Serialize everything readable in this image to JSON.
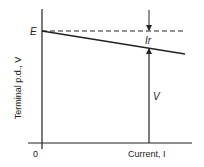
{
  "diagram": {
    "y_axis_label": "Terminal p.d., V",
    "x_axis_label": "Current, I",
    "origin_label": "0",
    "intercept_label": "E",
    "drop_label": "Ir",
    "voltage_label": "V",
    "line_color": "#222222",
    "elements": [
      {
        "type": "axis",
        "name": "y-axis"
      },
      {
        "type": "axis",
        "name": "x-axis"
      },
      {
        "type": "dashed-line",
        "name": "emf-level",
        "meaning": "E constant"
      },
      {
        "type": "line",
        "name": "terminal-pd-line",
        "meaning": "V = E - Ir, decreasing with I"
      },
      {
        "type": "arrow",
        "name": "ir-arrow",
        "meaning": "lost volts Ir between E and V"
      },
      {
        "type": "arrow",
        "name": "v-arrow",
        "meaning": "terminal p.d. V at current I"
      }
    ]
  }
}
